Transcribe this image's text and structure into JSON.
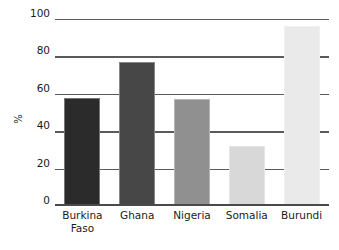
{
  "chart_data": {
    "type": "bar",
    "title": "",
    "xlabel": "",
    "ylabel": "%",
    "categories": [
      "Burkina Faso",
      "Ghana",
      "Nigeria",
      "Somalia",
      "Burundi"
    ],
    "values": [
      58,
      77,
      57,
      32,
      96
    ],
    "ylim": [
      0,
      100
    ],
    "yticks": [
      0,
      20,
      40,
      60,
      80,
      100
    ],
    "ytick_labels": [
      "0",
      "20",
      "40",
      "60",
      "80",
      "100"
    ],
    "grid": true,
    "legend": false,
    "bar_colors": [
      "#2b2b2b",
      "#474747",
      "#909090",
      "#d8d8d8",
      "#eaeaea"
    ],
    "grid_color": "#5a5a5a",
    "axis_color": "#4a4a4a",
    "background": "#ffffff",
    "series": [
      {
        "name": "%",
        "points": [
          {
            "category": "Burkina Faso",
            "label": "Burkina\nFaso",
            "value": 58,
            "color": "#2b2b2b"
          },
          {
            "category": "Ghana",
            "label": "Ghana",
            "value": 77,
            "color": "#474747"
          },
          {
            "category": "Nigeria",
            "label": "Nigeria",
            "value": 57,
            "color": "#909090"
          },
          {
            "category": "Somalia",
            "label": "Somalia",
            "value": 32,
            "color": "#d8d8d8"
          },
          {
            "category": "Burundi",
            "label": "Burundi",
            "value": 96,
            "color": "#eaeaea"
          }
        ]
      }
    ]
  }
}
